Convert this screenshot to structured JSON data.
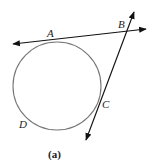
{
  "figure": {
    "caption": "(a)",
    "points": {
      "A": "A",
      "B": "B",
      "C": "C",
      "D": "D"
    },
    "circle": {
      "cx": 57,
      "cy": 86,
      "r": 44,
      "stroke": "#777777"
    },
    "lines": [
      {
        "name": "tangent-line-AB",
        "through": [
          "A",
          "B"
        ],
        "arrows": "both"
      },
      {
        "name": "tangent-line-BC",
        "through": [
          "B",
          "C"
        ],
        "arrows": "both"
      }
    ],
    "line_color": "#111111"
  }
}
